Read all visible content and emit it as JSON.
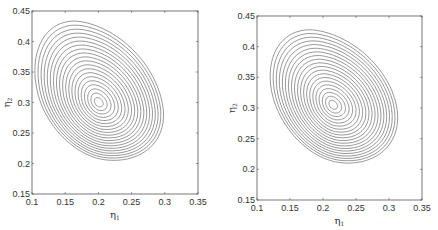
{
  "chart_data": [
    {
      "type": "contour",
      "title": "",
      "xlabel": "η1",
      "ylabel": "η2",
      "xlim": [
        0.1,
        0.35
      ],
      "ylim": [
        0.15,
        0.45
      ],
      "xticks": [
        0.1,
        0.15,
        0.2,
        0.25,
        0.3,
        0.35
      ],
      "yticks": [
        0.15,
        0.2,
        0.25,
        0.3,
        0.35,
        0.4,
        0.45
      ],
      "xtick_labels": [
        "0.1",
        "0.15",
        "0.2",
        "0.25",
        "0.3",
        "0.35"
      ],
      "ytick_labels": [
        "0.15",
        "0.2",
        "0.25",
        "0.3",
        "0.35",
        "0.4",
        "0.45"
      ],
      "grid": false,
      "center": [
        0.2,
        0.3
      ],
      "outer_extent": {
        "x": [
          0.115,
          0.305
        ],
        "y": [
          0.195,
          0.42
        ]
      },
      "n_levels": 20,
      "frame_px": {
        "left": 32,
        "top": 11,
        "right": 198,
        "bottom": 194
      }
    },
    {
      "type": "contour",
      "title": "",
      "xlabel": "η1",
      "ylabel": "η2",
      "xlim": [
        0.1,
        0.35
      ],
      "ylim": [
        0.15,
        0.45
      ],
      "xticks": [
        0.1,
        0.15,
        0.2,
        0.25,
        0.3,
        0.35
      ],
      "yticks": [
        0.15,
        0.2,
        0.25,
        0.3,
        0.35,
        0.4,
        0.45
      ],
      "xtick_labels": [
        "0.1",
        "0.15",
        "0.2",
        "0.25",
        "0.3",
        "0.35"
      ],
      "ytick_labels": [
        "0.15",
        "0.2",
        "0.25",
        "0.3",
        "0.35",
        "0.4",
        "0.45"
      ],
      "grid": false,
      "center": [
        0.215,
        0.305
      ],
      "outer_extent": {
        "x": [
          0.13,
          0.32
        ],
        "y": [
          0.2,
          0.415
        ]
      },
      "n_levels": 20,
      "frame_px": {
        "left": 257,
        "top": 16,
        "right": 422,
        "bottom": 200
      }
    }
  ],
  "labels": {
    "x_main": "η",
    "x_sub": "1",
    "y_main": "η",
    "y_sub": "2"
  }
}
